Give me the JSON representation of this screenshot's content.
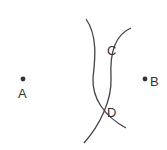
{
  "diagram": {
    "points": [
      {
        "id": "A",
        "label": "A"
      },
      {
        "id": "B",
        "label": "B"
      }
    ],
    "intersections": [
      {
        "id": "C",
        "label": "C"
      },
      {
        "id": "D",
        "label": "D"
      }
    ],
    "arcs": [
      {
        "id": "arc-centered-a",
        "center": "A",
        "passes_through": [
          "C",
          "D"
        ]
      },
      {
        "id": "arc-centered-b",
        "center": "B",
        "passes_through": [
          "C",
          "D"
        ]
      }
    ],
    "colors": {
      "stroke": "#444444",
      "text": "#333333"
    }
  }
}
